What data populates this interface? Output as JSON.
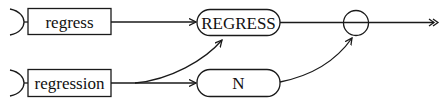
{
  "diagram": {
    "type": "syntax-flow",
    "colors": {
      "stroke": "#1a1a1a",
      "background": "#ffffff"
    },
    "nodes": [
      {
        "id": "regress",
        "shape": "rectangle",
        "label": "regress"
      },
      {
        "id": "regression",
        "shape": "rectangle",
        "label": "regression"
      },
      {
        "id": "REGRESS",
        "shape": "rounded",
        "label": "REGRESS"
      },
      {
        "id": "N",
        "shape": "rounded",
        "label": "N"
      },
      {
        "id": "join",
        "shape": "circle",
        "label": ""
      },
      {
        "id": "exit",
        "shape": "double-arrow",
        "label": ""
      }
    ],
    "edges": [
      {
        "from": "regress",
        "to": "REGRESS"
      },
      {
        "from": "regression",
        "to": "REGRESS"
      },
      {
        "from": "regression",
        "to": "N"
      },
      {
        "from": "REGRESS",
        "to": "join"
      },
      {
        "from": "N",
        "to": "join"
      },
      {
        "from": "join",
        "to": "exit"
      }
    ]
  }
}
